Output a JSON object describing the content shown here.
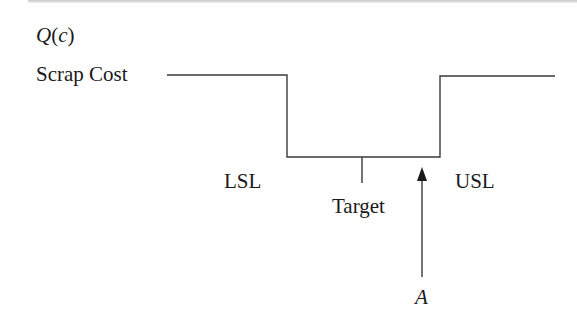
{
  "diagram": {
    "type": "step-loss-function",
    "y_axis_label": "Q(c)",
    "y_axis_label_parts": {
      "func": "Q",
      "arg": "c"
    },
    "level_label": "Scrap Cost",
    "lower_spec_label": "LSL",
    "upper_spec_label": "USL",
    "target_label": "Target",
    "arrow_label": "A",
    "line_color": "#3a3a3a",
    "text_color": "#1a1a1a"
  }
}
